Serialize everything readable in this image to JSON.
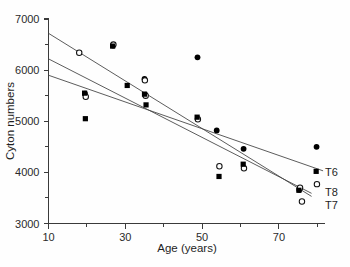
{
  "chart_data": {
    "type": "scatter",
    "title": "",
    "xlabel": "Age (years)",
    "ylabel": "Cyton numbers",
    "xlim": [
      10,
      82
    ],
    "ylim": [
      3000,
      7000
    ],
    "grid": false,
    "legend_position": "right-inline",
    "x_ticks_major": [
      10,
      30,
      50,
      70
    ],
    "x_ticks_minor": [
      20,
      40,
      60,
      80
    ],
    "y_ticks_major": [
      3000,
      4000,
      5000,
      6000,
      7000
    ],
    "y_ticks_minor": [
      3500,
      4500,
      5500,
      6500
    ],
    "x_tick_labels": [
      "10",
      "30",
      "50",
      "70"
    ],
    "y_tick_labels": [
      "3000",
      "4000",
      "5000",
      "6000",
      "7000"
    ],
    "series": [
      {
        "name": "T6",
        "label": "T6",
        "marker": "filled-circle",
        "points": [
          {
            "x": 19.5,
            "y": 5540
          },
          {
            "x": 26.8,
            "y": 6480
          },
          {
            "x": 35.0,
            "y": 5830
          },
          {
            "x": 35.2,
            "y": 5520
          },
          {
            "x": 48.8,
            "y": 6250
          },
          {
            "x": 53.8,
            "y": 4820
          },
          {
            "x": 60.8,
            "y": 4460
          },
          {
            "x": 75.3,
            "y": 3660
          },
          {
            "x": 79.8,
            "y": 4500
          }
        ],
        "fit_line": {
          "x1": 10,
          "y1": 5900,
          "x2": 81.5,
          "y2": 4030
        }
      },
      {
        "name": "T7",
        "label": "T7",
        "marker": "open-circle",
        "points": [
          {
            "x": 18.0,
            "y": 6340
          },
          {
            "x": 19.7,
            "y": 5480
          },
          {
            "x": 26.9,
            "y": 6500
          },
          {
            "x": 35.1,
            "y": 5800
          },
          {
            "x": 35.3,
            "y": 5500
          },
          {
            "x": 48.9,
            "y": 5040
          },
          {
            "x": 54.5,
            "y": 4120
          },
          {
            "x": 60.9,
            "y": 4080
          },
          {
            "x": 75.5,
            "y": 3700
          },
          {
            "x": 76.0,
            "y": 3430
          },
          {
            "x": 79.9,
            "y": 3770
          }
        ],
        "fit_line": {
          "x1": 10,
          "y1": 6720,
          "x2": 78.5,
          "y2": 3530
        }
      },
      {
        "name": "T8",
        "label": "T8",
        "marker": "square",
        "points": [
          {
            "x": 19.4,
            "y": 5550
          },
          {
            "x": 19.6,
            "y": 5050
          },
          {
            "x": 26.7,
            "y": 6470
          },
          {
            "x": 30.5,
            "y": 5700
          },
          {
            "x": 35.0,
            "y": 5530
          },
          {
            "x": 35.4,
            "y": 5320
          },
          {
            "x": 48.7,
            "y": 5080
          },
          {
            "x": 54.4,
            "y": 3920
          },
          {
            "x": 60.7,
            "y": 4160
          },
          {
            "x": 75.2,
            "y": 3650
          },
          {
            "x": 79.7,
            "y": 4020
          }
        ],
        "fit_line": {
          "x1": 10,
          "y1": 6220,
          "x2": 78.5,
          "y2": 3590
        }
      }
    ]
  },
  "axes": {
    "y_title": "Cyton numbers",
    "x_title": "Age (years)"
  },
  "labels": {
    "t6": "T6",
    "t8": "T8",
    "t7": "T7"
  }
}
